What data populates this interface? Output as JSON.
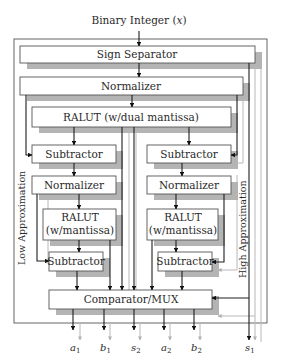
{
  "diagram": {
    "title": "Binary Integer (x)",
    "title_parts": {
      "text": "Binary Integer (",
      "var": "x",
      "close": ")"
    },
    "blocks": {
      "sign_separator": "Sign Separator",
      "normalizer_top": "Normalizer",
      "ralut_dual": "RALUT (w/dual mantissa)",
      "subtractor_left_1": "Subtractor",
      "subtractor_right_1": "Subtractor",
      "normalizer_left": "Normalizer",
      "normalizer_right": "Normalizer",
      "ralut_left_line1": "RALUT",
      "ralut_left_line2": "(w/mantissa)",
      "ralut_right_line1": "RALUT",
      "ralut_right_line2": "(w/mantissa)",
      "subtractor_left_2": "Subtractor",
      "subtractor_right_2": "Subtractor",
      "comparator_mux": "Comparator/MUX"
    },
    "side_labels": {
      "left": "Low Approximation",
      "right": "High Approximation"
    },
    "outputs": [
      {
        "base": "a",
        "sub": "1"
      },
      {
        "base": "b",
        "sub": "1"
      },
      {
        "base": "s",
        "sub": "2"
      },
      {
        "base": "a",
        "sub": "2"
      },
      {
        "base": "b",
        "sub": "2"
      },
      {
        "base": "s",
        "sub": "1"
      }
    ],
    "colors": {
      "line": "#1e1e1e",
      "ghost_line": "#b8b8b8",
      "shadow": "#b4b4b4",
      "box_border": "#555555"
    }
  }
}
